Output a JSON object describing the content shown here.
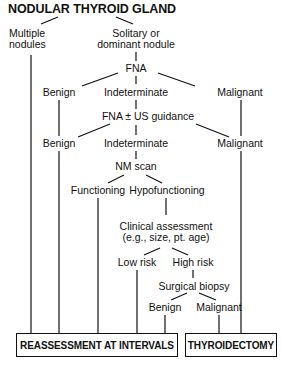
{
  "title": "NODULAR THYROID GLAND",
  "nodes": {
    "multiple_nodules": {
      "line1": "Multiple",
      "line2": "nodules"
    },
    "solitary": {
      "line1": "Solitary or",
      "line2": "dominant nodule"
    },
    "fna": "FNA",
    "benign_1": "Benign",
    "indeterminate_1": "Indeterminate",
    "malignant_1": "Malignant",
    "fna_us": "FNA ± US guidance",
    "benign_2": "Benign",
    "indeterminate_2": "Indeterminate",
    "malignant_2": "Malignant",
    "nm_scan": "NM scan",
    "functioning": "Functioning",
    "hypofunctioning": "Hypofunctioning",
    "clinical": {
      "line1": "Clinical assessment",
      "line2": "(e.g., size, pt. age)"
    },
    "low_risk": "Low risk",
    "high_risk": "High risk",
    "surgical_biopsy": "Surgical biopsy",
    "benign_3": "Benign",
    "malignant_3": "Malignant"
  },
  "outcomes": {
    "reassessment": "REASSESSMENT AT INTERVALS",
    "thyroidectomy": "THYROIDECTOMY"
  }
}
